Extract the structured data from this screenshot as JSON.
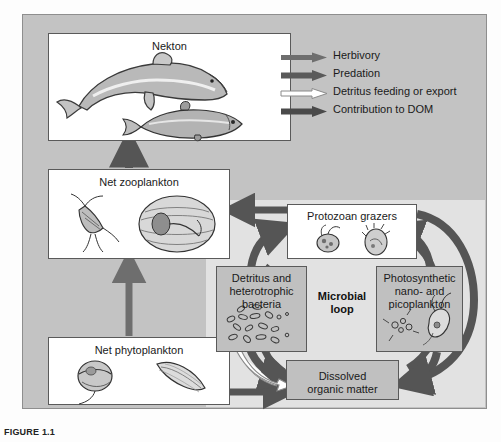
{
  "figure": {
    "caption_label": "FIGURE",
    "caption_number": "1.1"
  },
  "boxes": {
    "nekton": "Nekton",
    "net_zooplankton": "Net zooplankton",
    "net_phytoplankton": "Net phytoplankton",
    "protozoan_grazers": "Protozoan grazers",
    "detritus_bacteria": "Detritus and\nheterotrophic\nbacteria",
    "detritus_line1": "Detritus and",
    "detritus_line2": "heterotrophic",
    "detritus_line3": "bacteria",
    "photosynthetic_line1": "Photosynthetic",
    "photosynthetic_line2": "nano- and",
    "photosynthetic_line3": "picoplankton",
    "dom_line1": "Dissolved",
    "dom_line2": "organic matter",
    "microbial_loop_line1": "Microbial",
    "microbial_loop_line2": "loop"
  },
  "legend": {
    "items": [
      {
        "label": "Herbivory",
        "style": "solid-gray",
        "color": "#6e6e6e"
      },
      {
        "label": "Predation",
        "style": "solid-dark",
        "color": "#5a5a5a"
      },
      {
        "label": "Detritus feeding or export",
        "style": "outline-white",
        "color": "#ffffff"
      },
      {
        "label": "Contribution to DOM",
        "style": "solid-dark",
        "color": "#4a4a4a"
      }
    ]
  },
  "colors": {
    "panel_background": "#c3c3c3",
    "loop_background": "#e2e2e2",
    "box_white": "#ffffff",
    "box_gray": "#c0c0c0",
    "arrow_dark": "#555555",
    "arrow_mid": "#6e6e6e",
    "arrow_white": "#ffffff",
    "border": "#5a5a5a"
  },
  "organisms": {
    "nekton": [
      "dolphin",
      "fish"
    ],
    "net_zooplankton": [
      "copepod",
      "larvacean"
    ],
    "net_phytoplankton": [
      "dinoflagellate",
      "diatom"
    ],
    "protozoan_grazers": [
      "flagellate",
      "ciliate"
    ],
    "photosynthetic": [
      "picoplankton-cluster",
      "nanoflagellate"
    ],
    "detritus": [
      "bacteria-rods"
    ]
  }
}
